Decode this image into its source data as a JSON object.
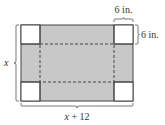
{
  "diagram": {
    "colors": {
      "shaded": "#c8c8c8",
      "corner": "#ffffff",
      "stroke": "#444444",
      "text": "#333333"
    },
    "labels": {
      "corner_width": "6 in.",
      "corner_height": "6 in.",
      "height_var": "x",
      "width_expr_var": "x",
      "width_expr_rest": " + 12"
    }
  }
}
